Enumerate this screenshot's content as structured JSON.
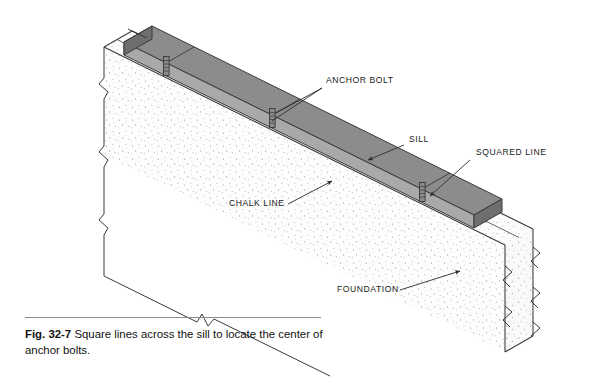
{
  "figure": {
    "number": "Fig. 32-7",
    "caption": "Square lines across the sill to locate the center of anchor bolts.",
    "domain_note": "isometric technical illustration of foundation wall with sill plate"
  },
  "labels": [
    {
      "id": "anchor-bolt",
      "text": "ANCHOR BOLT",
      "x": 326,
      "y": 83
    },
    {
      "id": "sill",
      "text": "SILL",
      "x": 409,
      "y": 142
    },
    {
      "id": "squared-line",
      "text": "SQUARED LINE",
      "x": 476,
      "y": 155
    },
    {
      "id": "chalk-line",
      "text": "CHALK LINE",
      "x": 229,
      "y": 206
    },
    {
      "id": "foundation",
      "text": "FOUNDATION",
      "x": 337,
      "y": 292
    }
  ],
  "colors": {
    "page_background": "#ffffff",
    "sill_top": "#8c8c8c",
    "sill_side": "#a9a9a9",
    "sill_end": "#6e6e6e",
    "foundation_face": "#fdfdfd",
    "foundation_top": "#fbfbfb",
    "foundation_right": "#f7f7f7",
    "stipple_dot": "#9aa0a8",
    "outline": "#3a3a3a",
    "leader_line": "#2b2b2b",
    "label_text": "#1a1a1a",
    "caption_rule": "#8c8c8c",
    "bolt_body": "#8a8a8a"
  },
  "elements": {
    "sill_plate": "gray rectangular timber sill plate running diagonally down-right along top of foundation wall",
    "anchor_bolts": 3,
    "squared_lines": 3,
    "chalk_line": "single line scribed on foundation top face parallel to sill",
    "break_marks_left": 3,
    "break_marks_right": 3,
    "break_marks_bottom": 2
  }
}
